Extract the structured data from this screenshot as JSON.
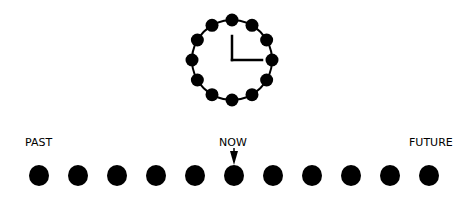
{
  "diagram": {
    "clock": {
      "time": "3:00",
      "hour": 3,
      "minute": 0,
      "hour_markers": 12,
      "icon": "clock-icon"
    },
    "timeline": {
      "dot_count": 11,
      "now_index": 5,
      "labels": {
        "past": "PAST",
        "now": "NOW",
        "future": "FUTURE"
      },
      "pointer_icon": "arrow-down-icon"
    },
    "colors": {
      "ink": "#000000",
      "background": "#ffffff"
    }
  }
}
